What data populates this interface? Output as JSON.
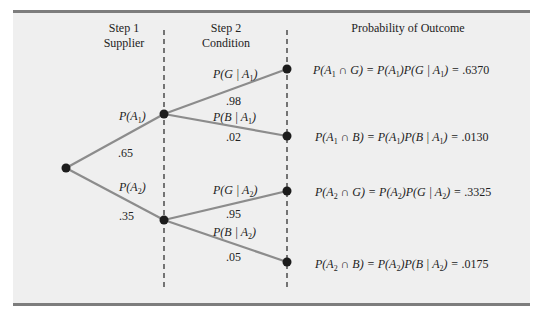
{
  "headers": {
    "step1": {
      "line1": "Step 1",
      "line2": "Supplier"
    },
    "step2": {
      "line1": "Step 2",
      "line2": "Condition"
    },
    "outcome": "Probability of Outcome"
  },
  "branches": {
    "a1": {
      "label_fn": "P(",
      "label_var": "A",
      "label_sub": "1",
      "label_close": ")",
      "value": ".65"
    },
    "a2": {
      "label_fn": "P(",
      "label_var": "A",
      "label_sub": "2",
      "label_close": ")",
      "value": ".35"
    },
    "g_a1": {
      "label": "P(G | A",
      "sub": "1",
      "close": ")",
      "value": ".98"
    },
    "b_a1": {
      "label": "P(B | A",
      "sub": "1",
      "close": ")",
      "value": ".02"
    },
    "g_a2": {
      "label": "P(G | A",
      "sub": "2",
      "close": ")",
      "value": ".95"
    },
    "b_a2": {
      "label": "P(B | A",
      "sub": "2",
      "close": ")",
      "value": ".05"
    }
  },
  "outcomes": [
    {
      "left": "P(A",
      "sub1": "1",
      "mid1": " ∩ G) = P(A",
      "sub2": "1",
      "mid2": ")P(G | A",
      "sub3": "1",
      "end": ") = ",
      "value": ".6370"
    },
    {
      "left": "P(A",
      "sub1": "1",
      "mid1": " ∩ B) = P(A",
      "sub2": "1",
      "mid2": ")P(B | A",
      "sub3": "1",
      "end": ") = ",
      "value": ".0130"
    },
    {
      "left": "P(A",
      "sub1": "2",
      "mid1": " ∩ G) = P(A",
      "sub2": "2",
      "mid2": ")P(G | A",
      "sub3": "2",
      "end": ") = ",
      "value": ".3325"
    },
    {
      "left": "P(A",
      "sub1": "2",
      "mid1": " ∩ B) = P(A",
      "sub2": "2",
      "mid2": ")P(B | A",
      "sub3": "2",
      "end": ") = ",
      "value": ".0175"
    }
  ],
  "colors": {
    "panel_bg": "#efefef",
    "rule": "#7d7d7d",
    "branch": "#8c8c8c",
    "node": "#1c1c1c",
    "dash": "#222222"
  }
}
